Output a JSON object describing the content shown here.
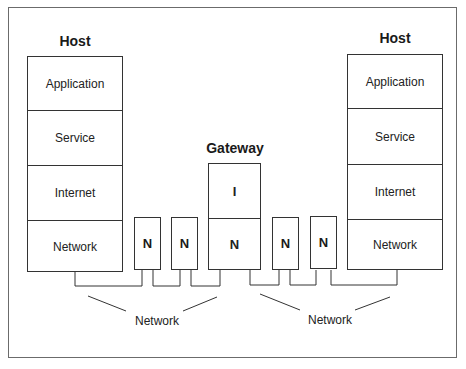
{
  "diagram": {
    "left_host": {
      "title": "Host",
      "layers": [
        "Application",
        "Service",
        "Internet",
        "Network"
      ]
    },
    "right_host": {
      "title": "Host",
      "layers": [
        "Application",
        "Service",
        "Internet",
        "Network"
      ]
    },
    "gateway": {
      "title": "Gateway",
      "layers": [
        "I",
        "N"
      ]
    },
    "routers_left": [
      "N",
      "N"
    ],
    "routers_right": [
      "N",
      "N"
    ],
    "network_labels": [
      "Network",
      "Network"
    ]
  },
  "colors": {
    "line": "#333333",
    "frame": "#6b6b6b",
    "background": "#ffffff"
  }
}
